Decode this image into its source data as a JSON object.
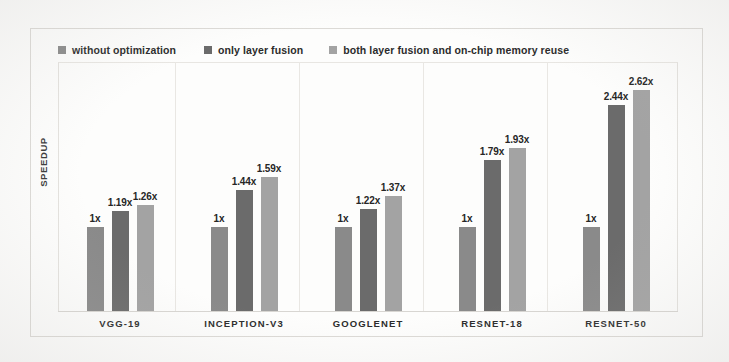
{
  "figure": {
    "y_axis_title": "SPEEDUP",
    "background_color": "#fdfdfc",
    "frame_color": "#dcdad6"
  },
  "legend": {
    "position": "top-left",
    "entries": [
      {
        "label": "without optimization",
        "color": "#8a8a8a",
        "marker": "square-swatch"
      },
      {
        "label": "only layer fusion",
        "color": "#6b6b6b",
        "marker": "square-swatch"
      },
      {
        "label": "both layer fusion and on-chip memory reuse",
        "color": "#a3a3a3",
        "marker": "square-swatch"
      }
    ]
  },
  "chart_data": {
    "type": "bar",
    "title": "",
    "subtitle": "",
    "xlabel": "",
    "ylabel": "SPEEDUP",
    "categories": [
      "VGG-19",
      "INCEPTION-V3",
      "GOOGLENET",
      "RESNET-18",
      "RESNET-50"
    ],
    "series": [
      {
        "name": "without optimization",
        "color": "#8a8a8a",
        "values": [
          1,
          1,
          1,
          1,
          1
        ],
        "labels": [
          "1x",
          "1x",
          "1x",
          "1x",
          "1x"
        ]
      },
      {
        "name": "only layer fusion",
        "color": "#6b6b6b",
        "values": [
          1.19,
          1.44,
          1.22,
          1.79,
          2.44
        ],
        "labels": [
          "1.19x",
          "1.44x",
          "1.22x",
          "1.79x",
          "2.44x"
        ]
      },
      {
        "name": "both layer fusion and on-chip memory reuse",
        "color": "#a3a3a3",
        "values": [
          1.26,
          1.59,
          1.37,
          1.93,
          2.62
        ],
        "labels": [
          "1.26x",
          "1.59x",
          "1.37x",
          "1.93x",
          "2.62x"
        ]
      }
    ],
    "ylim": [
      0,
      2.95
    ],
    "grid": false,
    "y_ticks_visible": false,
    "legend_position": "top-left",
    "group_separators": true
  }
}
